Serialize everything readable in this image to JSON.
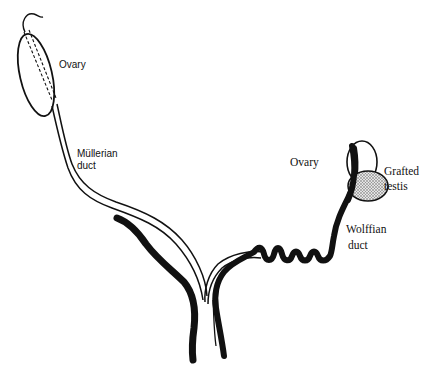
{
  "figure": {
    "type": "anatomical-diagram",
    "colors": {
      "line": "#111111",
      "background": "#ffffff",
      "testis_fill": "#c9c9c9"
    }
  },
  "labels": {
    "left_ovary": "Ovary",
    "mullerian_duct_line1": "Müllerian",
    "mullerian_duct_line2": "duct",
    "right_ovary": "Ovary",
    "grafted_testis_line1": "Grafted",
    "grafted_testis_line2": "testis",
    "wolffian_duct_line1": "Wolffian",
    "wolffian_duct_line2": "duct"
  },
  "structures": [
    {
      "name": "left-ovary",
      "shape": "ellipse",
      "fill": "none"
    },
    {
      "name": "mullerian-duct-left",
      "shape": "double-line tube"
    },
    {
      "name": "wolffian-duct-left",
      "shape": "thick black segment (regressed)"
    },
    {
      "name": "right-ovary",
      "shape": "ellipse",
      "fill": "none"
    },
    {
      "name": "grafted-testis",
      "shape": "stippled ellipse"
    },
    {
      "name": "wolffian-duct-right",
      "shape": "thick black coiled duct"
    },
    {
      "name": "mullerian-duct-right",
      "shape": "double-line tube (regressed, short)"
    },
    {
      "name": "urogenital-sinus",
      "shape": "joined ducts at bottom"
    }
  ]
}
